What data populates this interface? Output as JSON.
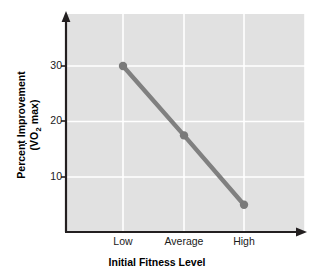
{
  "chart_data": {
    "type": "line",
    "title": "",
    "categories": [
      "Low",
      "Average",
      "High"
    ],
    "values": [
      30,
      17.5,
      5
    ],
    "series": [
      {
        "name": "Percent Improvement",
        "values": [
          30,
          17.5,
          5
        ]
      }
    ],
    "xlabel": "Initial Fitness Level",
    "ylabel_line1": "Percent Improvement",
    "ylabel_line2_prefix": "(",
    "ylabel_line2_v": "V",
    "ylabel_line2_o": "O",
    "ylabel_line2_sub": "2",
    "ylabel_line2_suffix": " max)",
    "ylabel_full": "Percent Improvement (VO2 max)",
    "yticks": [
      10,
      20,
      30
    ],
    "ytick_labels": [
      "10",
      "20",
      "30"
    ],
    "ylim": [
      0,
      38
    ],
    "xlim": [
      0,
      4
    ],
    "grid": true,
    "legend": "none",
    "colors": {
      "plot_background": "#e1e1e1",
      "gridline": "#ffffff",
      "series_line": "#808080",
      "marker": "#7a7a7a",
      "axis": "#231f20",
      "text": "#1a1a1a",
      "page_background": "#ffffff"
    }
  },
  "axis": {
    "y_tick_30": "30",
    "y_tick_20": "20",
    "y_tick_10": "10",
    "x_tick_low": "Low",
    "x_tick_average": "Average",
    "x_tick_high": "High"
  }
}
